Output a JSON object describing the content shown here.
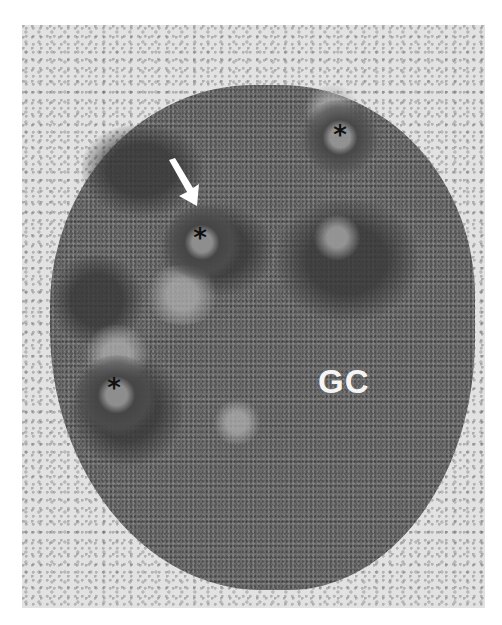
{
  "figure": {
    "type": "transmission electron micrograph",
    "labels": {
      "granular_component": "GC",
      "marker_symbol": "*"
    },
    "markers": [
      {
        "symbol": "*",
        "x": 340,
        "y": 140
      },
      {
        "symbol": "*",
        "x": 200,
        "y": 243
      },
      {
        "symbol": "*",
        "x": 114,
        "y": 393
      }
    ],
    "arrow": {
      "color": "#ffffff",
      "direction": "down-right",
      "tip_x": 195,
      "tip_y": 197
    },
    "colors": {
      "background": "#ffffff",
      "nucleoplasm": "#e2e2e2",
      "nucleolus": "#6b6b6b",
      "label_text": "#f4f4f4",
      "asterisk": "#111111"
    }
  }
}
